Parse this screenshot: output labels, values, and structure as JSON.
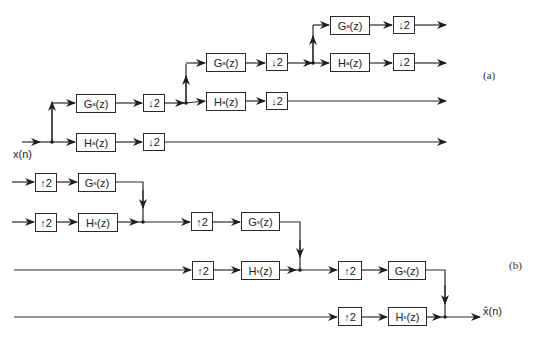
{
  "figure": {
    "part_a_label": "(a)",
    "part_b_label": "(b)",
    "input_label": "x(n)",
    "output_label": "x̂(n)"
  },
  "analysis": {
    "blocks": [
      {
        "id": "a1-g",
        "filter": "G",
        "sub": "a",
        "x": 76,
        "y": 94,
        "w": 40,
        "h": 19
      },
      {
        "id": "a1-g-down",
        "op": "↓2",
        "x": 143,
        "y": 94,
        "w": 22,
        "h": 18
      },
      {
        "id": "a1-h",
        "filter": "H",
        "sub": "a",
        "x": 76,
        "y": 133,
        "w": 40,
        "h": 19
      },
      {
        "id": "a1-h-down",
        "op": "↓2",
        "x": 143,
        "y": 133,
        "w": 22,
        "h": 18
      },
      {
        "id": "a2-g",
        "filter": "G",
        "sub": "a",
        "x": 206,
        "y": 53,
        "w": 40,
        "h": 19
      },
      {
        "id": "a2-g-down",
        "op": "↓2",
        "x": 266,
        "y": 53,
        "w": 22,
        "h": 18
      },
      {
        "id": "a2-h",
        "filter": "H",
        "sub": "a",
        "x": 206,
        "y": 92,
        "w": 40,
        "h": 19
      },
      {
        "id": "a2-h-down",
        "op": "↓2",
        "x": 266,
        "y": 92,
        "w": 22,
        "h": 18
      },
      {
        "id": "a3-g",
        "filter": "G",
        "sub": "a",
        "x": 330,
        "y": 16,
        "w": 40,
        "h": 19
      },
      {
        "id": "a3-g-down",
        "op": "↓2",
        "x": 393,
        "y": 16,
        "w": 22,
        "h": 18
      },
      {
        "id": "a3-h",
        "filter": "H",
        "sub": "a",
        "x": 330,
        "y": 53,
        "w": 40,
        "h": 19
      },
      {
        "id": "a3-h-down",
        "op": "↓2",
        "x": 393,
        "y": 53,
        "w": 22,
        "h": 18
      }
    ]
  },
  "synthesis": {
    "blocks": [
      {
        "id": "s1-g-up",
        "op": "↑2",
        "x": 35,
        "y": 173,
        "w": 22,
        "h": 19
      },
      {
        "id": "s1-g",
        "filter": "G",
        "sub": "s",
        "x": 78,
        "y": 173,
        "w": 38,
        "h": 19
      },
      {
        "id": "s1-h-up",
        "op": "↑2",
        "x": 35,
        "y": 213,
        "w": 22,
        "h": 19
      },
      {
        "id": "s1-h",
        "filter": "H",
        "sub": "s",
        "x": 78,
        "y": 213,
        "w": 40,
        "h": 19
      },
      {
        "id": "s2-g-up",
        "op": "↑2",
        "x": 191,
        "y": 212,
        "w": 22,
        "h": 19
      },
      {
        "id": "s2-g",
        "filter": "G",
        "sub": "s",
        "x": 241,
        "y": 212,
        "w": 39,
        "h": 19
      },
      {
        "id": "s2-h-up",
        "op": "↑2",
        "x": 192,
        "y": 261,
        "w": 22,
        "h": 19
      },
      {
        "id": "s2-h",
        "filter": "H",
        "sub": "s",
        "x": 241,
        "y": 261,
        "w": 39,
        "h": 19
      },
      {
        "id": "s3-g-up",
        "op": "↑2",
        "x": 338,
        "y": 261,
        "w": 24,
        "h": 19
      },
      {
        "id": "s3-g",
        "filter": "G",
        "sub": "s",
        "x": 388,
        "y": 261,
        "w": 38,
        "h": 19
      },
      {
        "id": "s3-h-up",
        "op": "↑2",
        "x": 338,
        "y": 307,
        "w": 24,
        "h": 19
      },
      {
        "id": "s3-h",
        "filter": "H",
        "sub": "s",
        "x": 388,
        "y": 307,
        "w": 39,
        "h": 19
      }
    ]
  }
}
